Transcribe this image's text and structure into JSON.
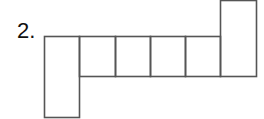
{
  "problem": {
    "number_label": "2."
  },
  "diagram": {
    "type": "net-of-squares",
    "stroke_color": "#555555",
    "cells": [
      {
        "id": "left-tall",
        "x": 44,
        "y": 36,
        "w": 35,
        "h": 81
      },
      {
        "id": "square-1",
        "x": 79,
        "y": 36,
        "w": 36,
        "h": 40
      },
      {
        "id": "square-2",
        "x": 115,
        "y": 36,
        "w": 35,
        "h": 40
      },
      {
        "id": "square-3",
        "x": 150,
        "y": 36,
        "w": 35,
        "h": 40
      },
      {
        "id": "square-4",
        "x": 185,
        "y": 36,
        "w": 35,
        "h": 40
      },
      {
        "id": "right-tall",
        "x": 220,
        "y": 0,
        "w": 36,
        "h": 76
      }
    ]
  }
}
